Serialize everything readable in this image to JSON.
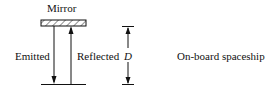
{
  "diagram": {
    "mirror_label": "Mirror",
    "emitted_label": "Emitted",
    "reflected_label": "Reflected",
    "distance_label": "D",
    "frame_label": "On-board spaceship"
  }
}
